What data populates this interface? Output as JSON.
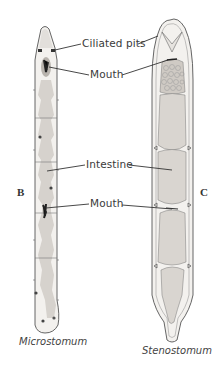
{
  "figure": {
    "panels": [
      {
        "letter": "B",
        "caption": "Microstomum"
      },
      {
        "letter": "C",
        "caption": "Stenostomum"
      }
    ],
    "labels": {
      "ciliated_pits": "Ciliated pits",
      "mouth_top": "Mouth",
      "intestine": "Intestine",
      "mouth_bottom": "Mouth"
    },
    "colors": {
      "outline": "#4a4a4a",
      "body_fill": "#f1efec",
      "gut_fill": "#d3cfca",
      "dark_spot": "#2a2a2a",
      "leader": "#333333"
    }
  }
}
